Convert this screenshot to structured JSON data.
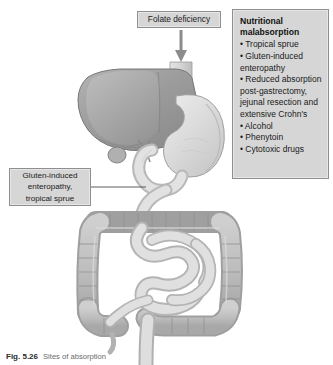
{
  "figure": {
    "background_color": "#ffffff",
    "callout_fill": "#d6d6d6",
    "callout_border": "#8f8f8f"
  },
  "folate_callout": {
    "text": "Folate deficiency"
  },
  "gluten_callout": {
    "line1": "Gluten-induced",
    "line2": "enteropathy,",
    "line3": "tropical sprue"
  },
  "nutrition_callout": {
    "title_line1": "Nutritional",
    "title_line2": "malabsorption",
    "items": [
      "• Tropical sprue",
      "• Gluten-induced",
      "enteropathy",
      "• Reduced absorption",
      "post-gastrectomy,",
      "jejunal resection and",
      "extensive Crohn's",
      "• Alcohol",
      "• Phenytoin",
      "• Cytotoxic drugs"
    ]
  },
  "caption": {
    "label": "Fig. 5.26",
    "text": "Sites of absorption"
  },
  "anatomy": {
    "organs": [
      "esophagus",
      "liver",
      "gallbladder",
      "stomach",
      "duodenum",
      "jejunum-ileum",
      "ascending-colon",
      "transverse-colon",
      "descending-colon",
      "sigmoid-colon",
      "rectum",
      "appendix"
    ]
  }
}
